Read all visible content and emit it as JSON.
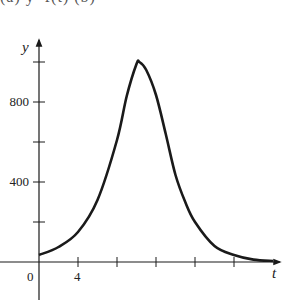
{
  "caption_clipped": "(a)          y=f(t)         (b)",
  "chart_data": {
    "type": "line",
    "title": "",
    "xlabel": "t",
    "ylabel": "y",
    "x_ticks": [
      0,
      4,
      8,
      12,
      16,
      20
    ],
    "x_tick_labels": [
      "0",
      "4"
    ],
    "y_ticks": [
      200,
      400,
      600,
      800,
      1000
    ],
    "y_tick_labels": [
      "400",
      "800"
    ],
    "xlim": [
      -2,
      25
    ],
    "ylim": [
      -120,
      1130
    ],
    "grid": false,
    "legend": null,
    "series": [
      {
        "name": "y",
        "x": [
          0,
          2,
          4,
          6,
          8,
          9,
          10,
          10.3,
          11,
          12,
          13,
          14,
          15,
          16,
          18,
          20,
          22,
          24
        ],
        "values": [
          35,
          75,
          150,
          310,
          610,
          830,
          990,
          1000,
          960,
          835,
          640,
          435,
          300,
          200,
          80,
          35,
          12,
          5
        ]
      }
    ],
    "color": "#1a1a1a"
  }
}
